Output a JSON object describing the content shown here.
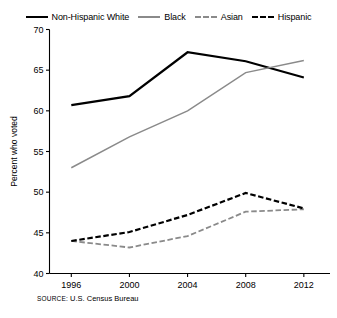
{
  "chart_data": {
    "type": "line",
    "title": "",
    "xlabel": "",
    "ylabel": "Percent who voted",
    "categories": [
      "1996",
      "2000",
      "2004",
      "2008",
      "2012"
    ],
    "x": [
      1996,
      2000,
      2004,
      2008,
      2012
    ],
    "xlim": [
      1994.5,
      2013.8
    ],
    "ylim": [
      40,
      70
    ],
    "yticks": [
      40,
      45,
      50,
      55,
      60,
      65,
      70
    ],
    "ytick_labels": [
      "40",
      "45",
      "50",
      "55",
      "60",
      "65",
      "70"
    ],
    "xtick_labels": [
      "1996",
      "2000",
      "2004",
      "2008",
      "2012"
    ],
    "grid": false,
    "legend_position": "top-center",
    "series": [
      {
        "name": "Non-Hispanic White",
        "values": [
          60.7,
          61.8,
          67.2,
          66.1,
          64.1
        ],
        "color": "#000000",
        "style": "solid",
        "width": 2.2
      },
      {
        "name": "Black",
        "values": [
          53.0,
          56.8,
          60.0,
          64.7,
          66.2
        ],
        "color": "#8a8a8a",
        "style": "solid",
        "width": 1.5
      },
      {
        "name": "Asian",
        "values": [
          44.0,
          43.2,
          44.6,
          47.6,
          47.9
        ],
        "color": "#8a8a8a",
        "style": "dashed",
        "width": 1.8
      },
      {
        "name": "Hispanic",
        "values": [
          44.0,
          45.1,
          47.2,
          49.9,
          48.0
        ],
        "color": "#000000",
        "style": "dashed",
        "width": 2.2
      }
    ]
  },
  "legend": {
    "items": [
      {
        "label": "Non-Hispanic White"
      },
      {
        "label": "Black"
      },
      {
        "label": "Asian"
      },
      {
        "label": "Hispanic"
      }
    ]
  },
  "source": {
    "prefix": "SOURCE:",
    "text": " U.S. Census Bureau"
  }
}
